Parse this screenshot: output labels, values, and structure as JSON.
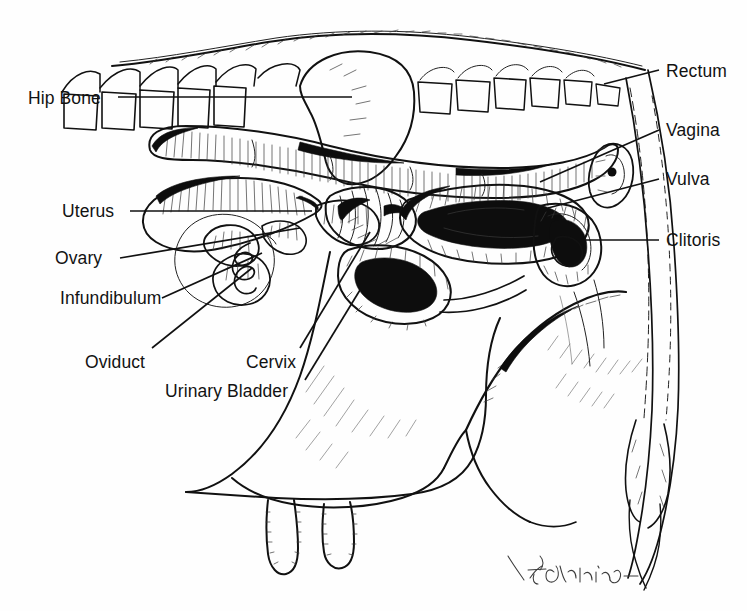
{
  "figure": {
    "background_color": "#fefefe",
    "ink_color": "#111111",
    "signature": "D. Giddings"
  },
  "labels_left": [
    {
      "id": "hip-bone",
      "text": "Hip Bone",
      "x": 28,
      "y": 90,
      "leader": [
        118,
        97,
        352,
        97
      ]
    },
    {
      "id": "uterus",
      "text": "Uterus",
      "x": 62,
      "y": 203,
      "leader": [
        130,
        211,
        312,
        211
      ]
    },
    {
      "id": "ovary",
      "text": "Ovary",
      "x": 55,
      "y": 250,
      "leader": [
        120,
        258,
        300,
        228
      ]
    },
    {
      "id": "infundibulum",
      "text": "Infundibulum",
      "x": 60,
      "y": 290,
      "leader": [
        162,
        298,
        262,
        253
      ]
    },
    {
      "id": "oviduct",
      "text": "Oviduct",
      "x": 85,
      "y": 354,
      "leader": [
        152,
        348,
        252,
        268
      ]
    },
    {
      "id": "cervix",
      "text": "Cervix",
      "x": 246,
      "y": 354,
      "leader": [
        300,
        348,
        370,
        232
      ]
    },
    {
      "id": "urinary-bladder",
      "text": "Urinary Bladder",
      "x": 165,
      "y": 383,
      "leader": [
        305,
        380,
        360,
        290
      ]
    }
  ],
  "labels_right": [
    {
      "id": "rectum",
      "text": "Rectum",
      "x": 666,
      "y": 63,
      "leader": [
        659,
        70,
        604,
        84
      ]
    },
    {
      "id": "vagina",
      "text": "Vagina",
      "x": 666,
      "y": 122,
      "leader": [
        659,
        130,
        540,
        182
      ]
    },
    {
      "id": "vulva",
      "text": "Vulva",
      "x": 666,
      "y": 171,
      "leader": [
        659,
        179,
        548,
        208
      ]
    },
    {
      "id": "clitoris",
      "text": "Clitoris",
      "x": 666,
      "y": 232,
      "leader": [
        659,
        240,
        585,
        240
      ]
    }
  ],
  "anatomy_parts": [
    "vertebral-column",
    "sacrum",
    "hip-bone",
    "rectum",
    "anus",
    "tail",
    "uterine-horn",
    "uterine-body",
    "cervix",
    "vagina",
    "vulva",
    "clitoris",
    "ovary",
    "oviduct",
    "infundibulum",
    "urinary-bladder",
    "udder",
    "teats"
  ]
}
